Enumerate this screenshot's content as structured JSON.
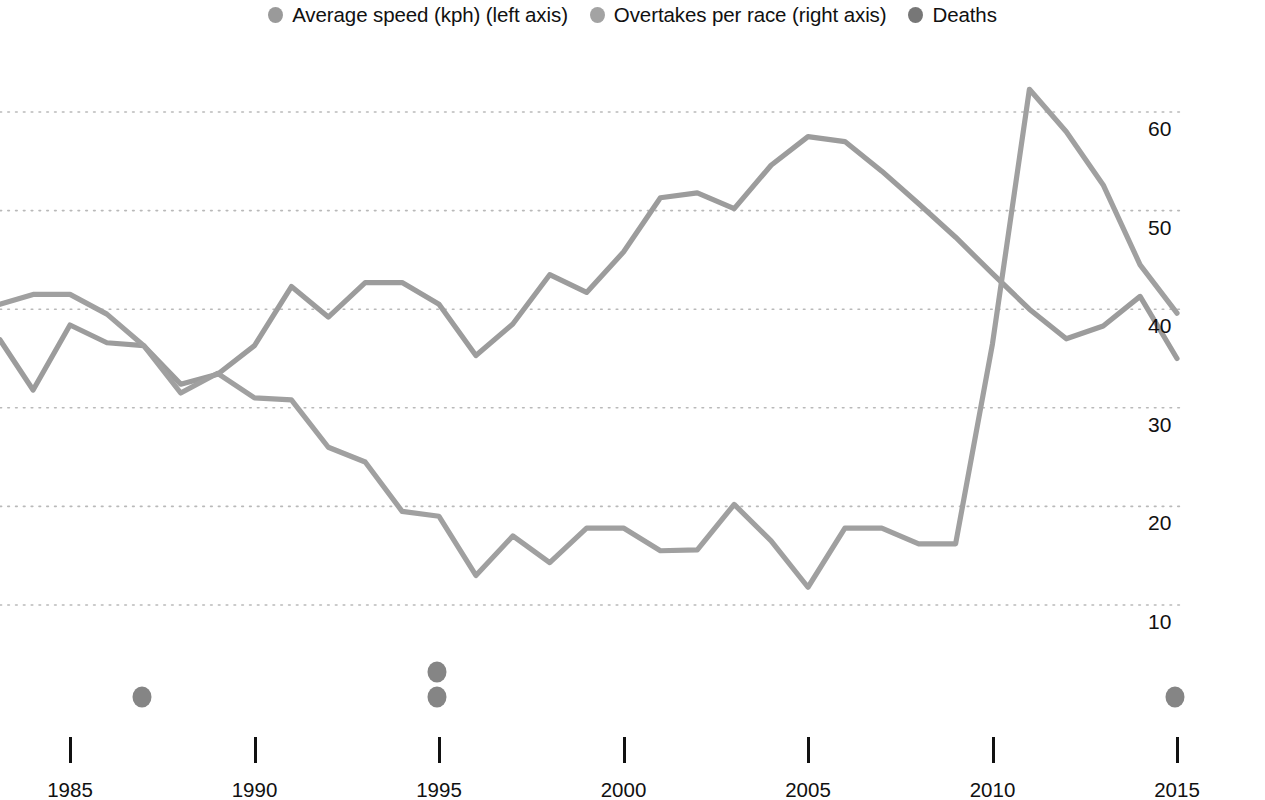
{
  "legend": {
    "items": [
      {
        "label": "Average speed (kph) (left axis)",
        "marker": "circle-marker",
        "color": "#9a9a9a"
      },
      {
        "label": "Overtakes per race (right axis)",
        "marker": "circle-marker",
        "color": "#a3a3a3"
      },
      {
        "label": "Deaths",
        "marker": "circle-marker",
        "color": "#777777"
      }
    ]
  },
  "chart_data": {
    "type": "line",
    "title": "",
    "xlabel": "",
    "ylabel": "",
    "grid": true,
    "legend_position": "top",
    "xlim": [
      1983.1,
      1216
    ],
    "x_ticks": [
      1985,
      1990,
      1995,
      2000,
      2005,
      2010,
      2015
    ],
    "x_tick_labels": [
      "1985",
      "1990",
      "1995",
      "2000",
      "2005",
      "2010",
      "2015"
    ],
    "right_axis": {
      "label": "Overtakes per race",
      "ticks": [
        10,
        20,
        30,
        40,
        50,
        60
      ],
      "tick_labels": [
        "10",
        "20",
        "30",
        "40",
        "50",
        "60"
      ],
      "ylim": [
        4,
        65
      ]
    },
    "left_axis": {
      "label": "Average speed (kph)",
      "ticks": [],
      "tick_labels": []
    },
    "series": [
      {
        "name": "Average speed (kph) (left axis)",
        "axis": "left",
        "color": "#9c9c9c",
        "x": [
          1983.1,
          1984,
          1985,
          1986,
          1987,
          1988,
          1989,
          1990,
          1991,
          1992,
          1993,
          1994,
          1995,
          1996,
          1997,
          1998,
          1999,
          2000,
          2001,
          2002,
          2003,
          2004,
          2005,
          2006,
          2007,
          2008,
          2009,
          2010,
          2011,
          2012,
          2013,
          2014,
          2015
        ],
        "values": [
          36.9,
          31.8,
          38.4,
          36.6,
          36.3,
          32.4,
          33.4,
          36.3,
          42.3,
          39.2,
          42.7,
          42.7,
          40.5,
          35.3,
          38.5,
          43.5,
          41.7,
          45.8,
          51.3,
          51.8,
          50.2,
          54.6,
          57.5,
          57.0,
          54.0,
          50.7,
          47.3,
          43.6,
          40.0,
          37.0,
          38.3,
          41.3,
          35.0
        ]
      },
      {
        "name": "Overtakes per race (right axis)",
        "axis": "right",
        "color": "#a0a0a0",
        "x": [
          1983.1,
          1984,
          1985,
          1986,
          1987,
          1988,
          1989,
          1990,
          1991,
          1992,
          1993,
          1994,
          1995,
          1996,
          1997,
          1998,
          1999,
          2000,
          2001,
          2002,
          2003,
          2004,
          2005,
          2006,
          2007,
          2008,
          2009,
          2010,
          2011,
          2012,
          2013,
          2014,
          2015
        ],
        "values": [
          40.5,
          41.5,
          41.5,
          39.5,
          36.3,
          31.5,
          33.5,
          31.0,
          30.8,
          26.0,
          24.5,
          19.5,
          19.0,
          13.0,
          17.0,
          14.3,
          17.8,
          17.8,
          15.5,
          15.6,
          20.2,
          16.5,
          11.8,
          17.8,
          17.8,
          16.2,
          16.2,
          36.5,
          62.3,
          58.0,
          52.6,
          44.5,
          39.6
        ]
      },
      {
        "name": "Deaths",
        "axis": "marker",
        "color": "#858585",
        "points": [
          {
            "year": 1986,
            "count": 1
          },
          {
            "year": 1994,
            "count": 2
          },
          {
            "year": 2014,
            "count": 1
          }
        ]
      }
    ]
  }
}
